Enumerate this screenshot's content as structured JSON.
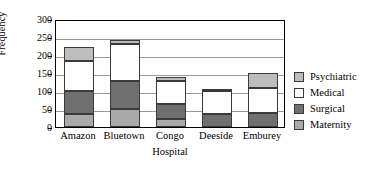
{
  "chart_data": {
    "type": "bar",
    "subtype": "stacked-bar",
    "title": "",
    "xlabel": "Hospital",
    "ylabel": "Frequency",
    "ylim": [
      0,
      300
    ],
    "yticks": [
      0,
      50,
      100,
      150,
      200,
      250,
      300
    ],
    "ytick_labels": [
      "0",
      "50",
      "100",
      "150",
      "200",
      "250",
      "300"
    ],
    "grid": true,
    "legend_position": "right",
    "categories": [
      "Amazon",
      "Bluetown",
      "Congo",
      "Deeside",
      "Emburey"
    ],
    "series": [
      {
        "name": "Maternity",
        "color": "#a9a9a9",
        "values": [
          35,
          51,
          22,
          0,
          0
        ]
      },
      {
        "name": "Surgical",
        "color": "#6f6f6f",
        "values": [
          65,
          76,
          43,
          35,
          38
        ]
      },
      {
        "name": "Medical",
        "color": "#ffffff",
        "values": [
          82,
          103,
          63,
          66,
          70
        ]
      },
      {
        "name": "Psychiatric",
        "color": "#bdbdbd",
        "values": [
          40,
          13,
          12,
          2,
          42
        ]
      }
    ],
    "totals": [
      222,
      243,
      140,
      103,
      150
    ]
  },
  "legend": {
    "items": [
      {
        "label": "Psychiatric",
        "color": "#bdbdbd"
      },
      {
        "label": "Medical",
        "color": "#ffffff"
      },
      {
        "label": "Surgical",
        "color": "#6f6f6f"
      },
      {
        "label": "Maternity",
        "color": "#a9a9a9"
      }
    ]
  }
}
